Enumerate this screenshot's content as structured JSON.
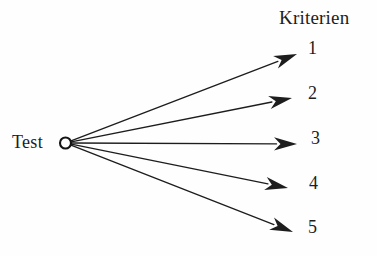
{
  "figure": {
    "type": "fan-out node-link diagram",
    "background_color": "#fefefe",
    "ink_color": "#1d1d1d",
    "width": 377,
    "height": 256
  },
  "header": {
    "label": "Kriterien"
  },
  "source": {
    "label": "Test",
    "node_icon": "circle-node-icon",
    "node": {
      "cx": 65.5,
      "cy": 143,
      "r": 5.5
    }
  },
  "criteria": [
    {
      "label": "1",
      "arrow_icon": "arrow-right-icon",
      "tip_x": 297,
      "tip_y": 54
    },
    {
      "label": "2",
      "arrow_icon": "arrow-right-icon",
      "tip_x": 292,
      "tip_y": 98
    },
    {
      "label": "3",
      "arrow_icon": "arrow-right-icon",
      "tip_x": 297,
      "tip_y": 144
    },
    {
      "label": "4",
      "arrow_icon": "arrow-right-icon",
      "tip_x": 288,
      "tip_y": 188
    },
    {
      "label": "5",
      "arrow_icon": "arrow-right-icon",
      "tip_x": 293,
      "tip_y": 232
    }
  ]
}
